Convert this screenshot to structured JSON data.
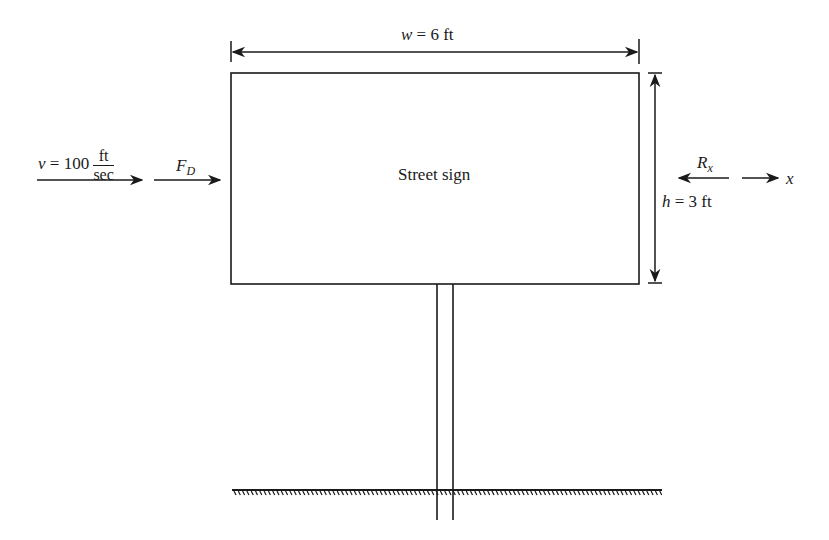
{
  "diagram": {
    "type": "free-body diagram",
    "sign_label": "Street sign",
    "width_dimension": {
      "var": "w",
      "eq": " = 6 ft"
    },
    "height_dimension": {
      "var": "h",
      "eq": " = 3 ft"
    },
    "velocity": {
      "var": "v",
      "eq": " = 100",
      "unit_num": "ft",
      "unit_den": "sec"
    },
    "drag_force": {
      "var": "F",
      "sub": "D"
    },
    "reaction": {
      "var": "R",
      "sub": "x"
    },
    "axis": {
      "label": "x"
    },
    "colors": {
      "line": "#1a1a1a",
      "background": "#ffffff"
    }
  }
}
